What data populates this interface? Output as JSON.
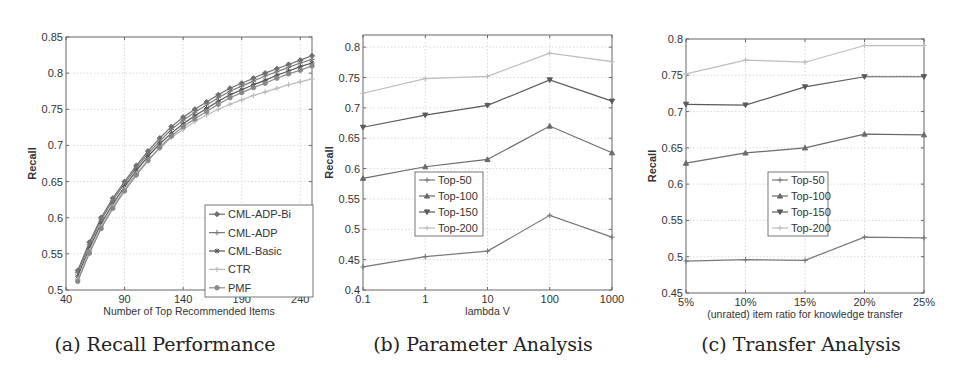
{
  "chart_data": [
    {
      "type": "line",
      "id": "a",
      "caption": "(a) Recall Performance",
      "title": "",
      "xlabel": "Number of Top Recommended Items",
      "ylabel": "Recall",
      "xlim": [
        40,
        250
      ],
      "ylim": [
        0.5,
        0.85
      ],
      "xticks": [
        40,
        90,
        140,
        190,
        240
      ],
      "yticks": [
        0.5,
        0.55,
        0.6,
        0.65,
        0.7,
        0.75,
        0.8,
        0.85
      ],
      "ytick_labels": [
        "0.5",
        "0.55",
        "0.6",
        "0.65",
        "0.7",
        "0.75",
        "0.8",
        "0.85"
      ],
      "grid": true,
      "legend_position": "lower right",
      "x": [
        50,
        60,
        70,
        80,
        90,
        100,
        110,
        120,
        130,
        140,
        150,
        160,
        170,
        180,
        190,
        200,
        210,
        220,
        230,
        240,
        250
      ],
      "series": [
        {
          "name": "CML-ADP-Bi",
          "color": "#6e6e6e",
          "marker": "diamond",
          "values": [
            0.527,
            0.566,
            0.6,
            0.627,
            0.65,
            0.672,
            0.692,
            0.71,
            0.726,
            0.739,
            0.75,
            0.76,
            0.77,
            0.779,
            0.786,
            0.793,
            0.8,
            0.806,
            0.812,
            0.818,
            0.824
          ]
        },
        {
          "name": "CML-ADP",
          "color": "#7a7a7a",
          "marker": "plus",
          "values": [
            0.524,
            0.563,
            0.597,
            0.624,
            0.647,
            0.669,
            0.689,
            0.706,
            0.722,
            0.735,
            0.746,
            0.756,
            0.766,
            0.775,
            0.782,
            0.789,
            0.796,
            0.802,
            0.808,
            0.814,
            0.819
          ]
        },
        {
          "name": "CML-Basic",
          "color": "#555555",
          "marker": "star",
          "values": [
            0.519,
            0.558,
            0.592,
            0.619,
            0.643,
            0.665,
            0.685,
            0.702,
            0.717,
            0.73,
            0.741,
            0.751,
            0.761,
            0.77,
            0.777,
            0.784,
            0.79,
            0.797,
            0.803,
            0.809,
            0.814
          ]
        },
        {
          "name": "CTR",
          "color": "#b8b8b8",
          "marker": "plus",
          "values": [
            0.515,
            0.554,
            0.588,
            0.616,
            0.64,
            0.661,
            0.68,
            0.696,
            0.711,
            0.722,
            0.733,
            0.742,
            0.75,
            0.757,
            0.763,
            0.769,
            0.774,
            0.779,
            0.784,
            0.788,
            0.792
          ]
        },
        {
          "name": "PMF",
          "color": "#888888",
          "marker": "circle",
          "values": [
            0.512,
            0.551,
            0.585,
            0.613,
            0.637,
            0.659,
            0.679,
            0.697,
            0.713,
            0.726,
            0.737,
            0.747,
            0.757,
            0.766,
            0.773,
            0.78,
            0.786,
            0.793,
            0.799,
            0.804,
            0.81
          ]
        }
      ]
    },
    {
      "type": "line",
      "id": "b",
      "caption": "(b) Parameter Analysis",
      "title": "",
      "xlabel": "lambda V",
      "ylabel": "Recall",
      "xscale": "log",
      "categories": [
        "0.1",
        "1",
        "10",
        "100",
        "1000"
      ],
      "ylim": [
        0.4,
        0.82
      ],
      "yticks": [
        0.4,
        0.45,
        0.5,
        0.55,
        0.6,
        0.65,
        0.7,
        0.75,
        0.8
      ],
      "ytick_labels": [
        "0.4",
        "0.45",
        "0.5",
        "0.55",
        "0.6",
        "0.65",
        "0.7",
        "0.75",
        "0.8"
      ],
      "grid": true,
      "legend_position": "center left",
      "series": [
        {
          "name": "Top-50",
          "color": "#777777",
          "marker": "plus",
          "values": [
            0.438,
            0.455,
            0.464,
            0.523,
            0.487
          ]
        },
        {
          "name": "Top-100",
          "color": "#6a6a6a",
          "marker": "triangle-up",
          "values": [
            0.584,
            0.603,
            0.615,
            0.67,
            0.626
          ]
        },
        {
          "name": "Top-150",
          "color": "#5a5a5a",
          "marker": "triangle-down",
          "values": [
            0.668,
            0.688,
            0.704,
            0.746,
            0.711
          ]
        },
        {
          "name": "Top-200",
          "color": "#bdbdbd",
          "marker": "plus",
          "values": [
            0.724,
            0.748,
            0.752,
            0.79,
            0.776
          ]
        }
      ]
    },
    {
      "type": "line",
      "id": "c",
      "caption": "(c) Transfer Analysis",
      "title": "",
      "xlabel": "(unrated) item ratio for knowledge transfer",
      "ylabel": "Recall",
      "categories": [
        "5%",
        "10%",
        "15%",
        "20%",
        "25%"
      ],
      "ylim": [
        0.45,
        0.8
      ],
      "yticks": [
        0.45,
        0.5,
        0.55,
        0.6,
        0.65,
        0.7,
        0.75,
        0.8
      ],
      "ytick_labels": [
        "0.45",
        "0.5",
        "0.55",
        "0.6",
        "0.65",
        "0.7",
        "0.75",
        "0.8"
      ],
      "grid": true,
      "legend_position": "center",
      "series": [
        {
          "name": "Top-50",
          "color": "#777777",
          "marker": "plus",
          "values": [
            0.494,
            0.496,
            0.495,
            0.527,
            0.526
          ]
        },
        {
          "name": "Top-100",
          "color": "#6a6a6a",
          "marker": "triangle-up",
          "values": [
            0.629,
            0.643,
            0.65,
            0.669,
            0.668
          ]
        },
        {
          "name": "Top-150",
          "color": "#5a5a5a",
          "marker": "triangle-down",
          "values": [
            0.71,
            0.709,
            0.734,
            0.748,
            0.748
          ]
        },
        {
          "name": "Top-200",
          "color": "#bdbdbd",
          "marker": "plus",
          "values": [
            0.752,
            0.771,
            0.768,
            0.791,
            0.791
          ]
        }
      ]
    }
  ],
  "layout": {
    "a": {
      "left": 66,
      "right": 312,
      "top": 37,
      "bottom": 290,
      "x0": 40,
      "x1": 250,
      "legend": {
        "x": 205,
        "y": 205,
        "w": 108,
        "h": 92
      }
    },
    "b": {
      "left": 363,
      "right": 612,
      "top": 35,
      "bottom": 290,
      "legend": {
        "x": 415,
        "y": 172,
        "w": 68,
        "h": 64
      }
    },
    "c": {
      "left": 686,
      "right": 924,
      "top": 39,
      "bottom": 293,
      "legend": {
        "x": 768,
        "y": 172,
        "w": 60,
        "h": 64
      }
    }
  }
}
